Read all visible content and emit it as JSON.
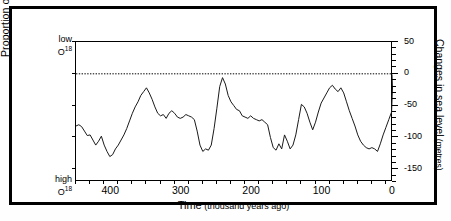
{
  "figure": {
    "background_color": "#ffffff",
    "border_color": "#000000",
    "line_color": "#1a1a1a"
  },
  "axes": {
    "left": {
      "title_text": "Proportion of O",
      "title_sup": "18",
      "title_unit": " (‰)",
      "top_label_line1": "low",
      "top_label_line2": "O",
      "top_label_sup": "18",
      "bottom_label_line1": "high",
      "bottom_label_line2": "O",
      "bottom_label_sup": "18"
    },
    "right": {
      "title_main": "Changes in sea level",
      "title_unit": " (metres)",
      "ticks": [
        {
          "value": 50,
          "label": "50"
        },
        {
          "value": 0,
          "label": "0"
        },
        {
          "value": -50,
          "label": "-50"
        },
        {
          "value": -100,
          "label": "-100"
        },
        {
          "value": -150,
          "label": "-150"
        }
      ],
      "minor_tick_step": 10,
      "range": [
        -170,
        50
      ]
    },
    "bottom": {
      "title_main": "Time",
      "title_unit": " (thousand years ago)",
      "ticks": [
        {
          "value": 400,
          "label": "400"
        },
        {
          "value": 300,
          "label": "300"
        },
        {
          "value": 200,
          "label": "200"
        },
        {
          "value": 100,
          "label": "100"
        },
        {
          "value": 0,
          "label": "0"
        }
      ],
      "minor_tick_step": 20,
      "range": [
        450,
        0
      ],
      "reversed": true
    }
  },
  "annotations": [
    {
      "name": "current-sea-level",
      "text": "current sea level",
      "y_value": 0,
      "line_style": "dotted"
    }
  ],
  "chart_data": {
    "type": "line",
    "title": "",
    "subtitle": "",
    "xlabel": "Time (thousand years ago)",
    "ylabel": "Changes in sea level (metres)",
    "ylabel_secondary": "Proportion of O18 (‰)",
    "xlim": [
      450,
      0
    ],
    "ylim": [
      -170,
      50
    ],
    "grid": false,
    "legend": "none",
    "x_units": "thousand years ago",
    "y_units": "metres",
    "series": [
      {
        "name": "Sea level change",
        "x": [
          450,
          446,
          442,
          438,
          434,
          430,
          426,
          422,
          418,
          414,
          410,
          406,
          402,
          398,
          394,
          390,
          386,
          382,
          378,
          374,
          370,
          366,
          362,
          358,
          354,
          350,
          346,
          342,
          338,
          334,
          330,
          326,
          322,
          318,
          314,
          310,
          306,
          302,
          298,
          294,
          290,
          286,
          282,
          278,
          274,
          270,
          266,
          262,
          258,
          254,
          250,
          246,
          242,
          238,
          234,
          230,
          226,
          222,
          218,
          214,
          210,
          206,
          202,
          198,
          194,
          190,
          186,
          182,
          178,
          174,
          170,
          166,
          162,
          158,
          154,
          150,
          146,
          142,
          138,
          134,
          130,
          126,
          122,
          118,
          114,
          110,
          106,
          102,
          98,
          94,
          90,
          86,
          82,
          78,
          74,
          70,
          66,
          62,
          58,
          54,
          50,
          46,
          42,
          38,
          34,
          30,
          26,
          22,
          18,
          14,
          10,
          6,
          2,
          0
        ],
        "values": [
          -82,
          -80,
          -83,
          -90,
          -97,
          -96,
          -104,
          -112,
          -106,
          -98,
          -112,
          -122,
          -130,
          -127,
          -118,
          -112,
          -104,
          -96,
          -86,
          -74,
          -62,
          -52,
          -44,
          -34,
          -28,
          -22,
          -30,
          -40,
          -52,
          -62,
          -66,
          -64,
          -70,
          -62,
          -58,
          -62,
          -68,
          -70,
          -68,
          -64,
          -66,
          -68,
          -72,
          -90,
          -112,
          -122,
          -118,
          -120,
          -112,
          -86,
          -54,
          -20,
          -6,
          -16,
          -34,
          -44,
          -50,
          -56,
          -58,
          -66,
          -68,
          -70,
          -66,
          -70,
          -72,
          -74,
          -72,
          -76,
          -80,
          -100,
          -116,
          -120,
          -110,
          -118,
          -96,
          -106,
          -118,
          -112,
          -96,
          -72,
          -48,
          -52,
          -62,
          -76,
          -88,
          -76,
          -60,
          -46,
          -38,
          -30,
          -22,
          -18,
          -24,
          -28,
          -22,
          -30,
          -44,
          -58,
          -70,
          -82,
          -96,
          -106,
          -112,
          -116,
          -118,
          -116,
          -118,
          -122,
          -110,
          -96,
          -84,
          -72,
          -60,
          -2
        ],
        "color": "#1a1a1a",
        "linewidth": 1
      }
    ],
    "features": {
      "interglacial_peaks_ka": [
        0,
        125,
        200,
        240,
        325,
        400
      ],
      "glacial_lows_ka": [
        20,
        140,
        265,
        340,
        430
      ],
      "max_value": 0,
      "min_value": -135
    }
  }
}
